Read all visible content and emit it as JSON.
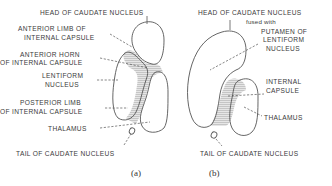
{
  "figure": {
    "panel_a": {
      "caption": "(a)",
      "labels": {
        "head_caudate": "HEAD OF CAUDATE NUCLEUS",
        "anterior_limb_1": "ANTERIOR LIMB OF",
        "anterior_limb_2": "INTERNAL CAPSULE",
        "anterior_horn_1": "ANTERIOR HORN",
        "anterior_horn_2": "OF INTERNAL CAPSULE",
        "lentiform_1": "LENTIFORM",
        "lentiform_2": "NUCLEUS",
        "posterior_limb_1": "POSTERIOR LIMB",
        "posterior_limb_2": "OF INTERNAL CAPSULE",
        "thalamus": "THALAMUS",
        "tail_caudate": "TAIL OF CAUDATE NUCLEUS"
      }
    },
    "panel_b": {
      "caption": "(b)",
      "labels": {
        "head_caudate": "HEAD OF CAUDATE NUCLEUS",
        "fused_with": "fused with",
        "putamen_1": "PUTAMEN OF",
        "putamen_2": "LENTIFORM",
        "putamen_3": "NUCLEUS",
        "internal_capsule_1": "INTERNAL",
        "internal_capsule_2": "CAPSULE",
        "thalamus": "THALAMUS",
        "tail_caudate": "TAIL OF CAUDATE NUCLEUS"
      }
    },
    "colors": {
      "line": "#555555",
      "text": "#3a3a3a",
      "background": "#ffffff"
    }
  }
}
